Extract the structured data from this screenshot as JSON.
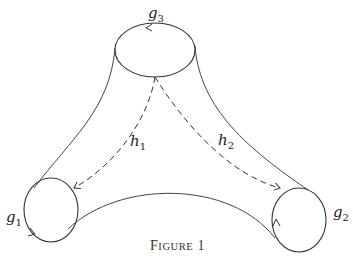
{
  "diagram": {
    "boundaries": [
      {
        "id": "g1",
        "label": "g",
        "sub": "1"
      },
      {
        "id": "g2",
        "label": "g",
        "sub": "2"
      },
      {
        "id": "g3",
        "label": "g",
        "sub": "3"
      }
    ],
    "arcs": [
      {
        "id": "h1",
        "label": "h",
        "sub": "1",
        "style": "dashed",
        "from": "g3",
        "to": "g1"
      },
      {
        "id": "h2",
        "label": "h",
        "sub": "2",
        "style": "dashed",
        "from": "g3",
        "to": "g2"
      }
    ],
    "colors": {
      "stroke": "#333333",
      "background": "#ffffff"
    }
  },
  "caption": {
    "first": "F",
    "rest": "IGURE",
    "number": "1"
  }
}
